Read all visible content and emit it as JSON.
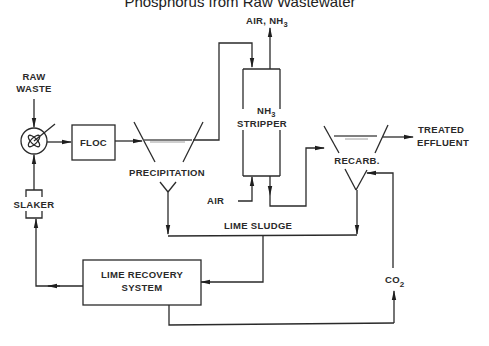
{
  "title": "Phosphorus from Raw Wastewater",
  "nodes": {
    "raw_waste": {
      "line1": "RAW",
      "line2": "WASTE"
    },
    "floc": "FLOC",
    "precipitation": "PRECIPITATION",
    "air_nh3": {
      "text": "AIR, NH",
      "sub": "3"
    },
    "stripper": {
      "line1": "NH",
      "line1_sub": "3",
      "line2": "STRIPPER"
    },
    "air": "AIR",
    "recarb": "RECARB.",
    "treated_effluent": {
      "line1": "TREATED",
      "line2": "EFFLUENT"
    },
    "slaker": "SLAKER",
    "lime_sludge": "LIME SLUDGE",
    "lime_recovery": {
      "line1": "LIME RECOVERY",
      "line2": "SYSTEM"
    },
    "co2": {
      "text": "CO",
      "sub": "2"
    }
  },
  "icons": {
    "mixer": "rapid-mix-tank-icon"
  },
  "colors": {
    "line": "#2a2a2a",
    "background": "#ffffff"
  }
}
